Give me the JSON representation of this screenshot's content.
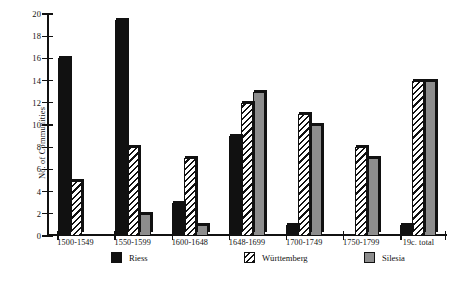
{
  "chart_data": {
    "type": "bar",
    "title": "",
    "xlabel": "",
    "ylabel": "No. of Communities",
    "ylim": [
      0,
      20
    ],
    "yticks": [
      0,
      2,
      4,
      6,
      8,
      10,
      12,
      14,
      16,
      18,
      20
    ],
    "grid": false,
    "legend_position": "bottom",
    "categories": [
      "1500-1549",
      "1550-1599",
      "1600-1648",
      "1648-1699",
      "1700-1749",
      "1750-1799",
      "19c. total"
    ],
    "series": [
      {
        "name": "Riess",
        "style": "solid-black",
        "color": "#111111",
        "values": [
          16,
          19.5,
          3,
          9,
          1,
          0,
          1
        ]
      },
      {
        "name": "Württemberg",
        "style": "diagonal-hatch",
        "color": "#ffffff",
        "values": [
          5,
          8,
          7,
          12,
          11,
          8,
          14
        ]
      },
      {
        "name": "Silesia",
        "style": "solid-gray",
        "color": "#8d8d8d",
        "values": [
          0,
          2,
          1,
          13,
          10,
          7,
          14
        ]
      }
    ]
  },
  "axes": {
    "y_title": "No. of Communities"
  }
}
